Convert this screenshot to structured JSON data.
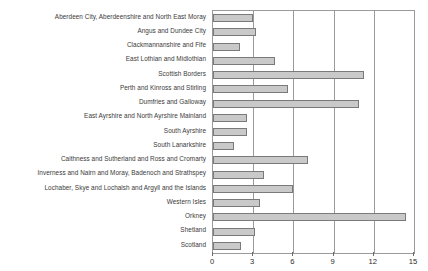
{
  "chart_data": {
    "type": "bar",
    "orientation": "horizontal",
    "title": "",
    "subtitle": "",
    "xlabel": "",
    "ylabel": "",
    "xlim": [
      0,
      15
    ],
    "xticks": [
      0,
      3,
      6,
      9,
      12,
      15
    ],
    "xtick_labels": [
      "0",
      "3",
      "6",
      "9",
      "12",
      "15"
    ],
    "grid": true,
    "legend": false,
    "legend_position": "none",
    "annotations": [],
    "bar_color": "#c9c9c9",
    "bar_edge_color": "#7a7a7a",
    "axis_color": "#9a9a9a",
    "categories": [
      "Aberdeen City, Aberdeenshire and North East Moray",
      "Angus and Dundee City",
      "Clackmannanshire and Fife",
      "East Lothian and Midlothian",
      "Scottish Borders",
      "Perth and Kinross and Stirling",
      "Dumfries and Galloway",
      "East Ayrshire and North Ayrshire Mainland",
      "South Ayrshire",
      "South Lanarkshire",
      "Caithness and Sutherland and Ross and Cromarty",
      "Inverness and Nairn and Moray, Badenoch and Strathspey",
      "Lochaber, Skye and Lochalsh and Argyll and the Islands",
      "Western Isles",
      "Orkney",
      "Shetland",
      "Scotland"
    ],
    "values": [
      3.0,
      3.2,
      2.0,
      4.6,
      11.3,
      5.6,
      10.9,
      2.5,
      2.5,
      1.6,
      7.1,
      3.8,
      6.0,
      3.5,
      14.4,
      3.1,
      2.1
    ]
  }
}
